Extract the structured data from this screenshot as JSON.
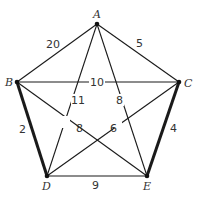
{
  "graph": {
    "vertices": [
      {
        "id": "A",
        "label": "A",
        "x": 97,
        "y": 24
      },
      {
        "id": "B",
        "label": "B",
        "x": 17,
        "y": 82
      },
      {
        "id": "C",
        "label": "C",
        "x": 179,
        "y": 82
      },
      {
        "id": "D",
        "label": "D",
        "x": 47,
        "y": 176
      },
      {
        "id": "E",
        "label": "E",
        "x": 147,
        "y": 176
      }
    ],
    "edges": [
      {
        "from": "A",
        "to": "B",
        "weight": "20",
        "bold": false
      },
      {
        "from": "A",
        "to": "C",
        "weight": "5",
        "bold": false
      },
      {
        "from": "B",
        "to": "C",
        "weight": "10",
        "bold": false
      },
      {
        "from": "A",
        "to": "D",
        "weight": "11",
        "bold": false
      },
      {
        "from": "A",
        "to": "E",
        "weight": "8",
        "bold": false
      },
      {
        "from": "B",
        "to": "E",
        "weight": "8",
        "bold": false
      },
      {
        "from": "C",
        "to": "D",
        "weight": "6",
        "bold": false
      },
      {
        "from": "B",
        "to": "D",
        "weight": "2",
        "bold": true
      },
      {
        "from": "C",
        "to": "E",
        "weight": "4",
        "bold": true
      },
      {
        "from": "D",
        "to": "E",
        "weight": "9",
        "bold": false
      }
    ]
  }
}
